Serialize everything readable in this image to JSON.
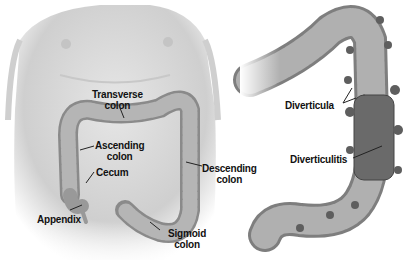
{
  "figure": {
    "left_panel": {
      "subject": "torso-with-colon",
      "labels": {
        "transverse": [
          "Transverse",
          "colon"
        ],
        "ascending": [
          "Ascending",
          "colon"
        ],
        "cecum": "Cecum",
        "appendix": "Appendix",
        "descending": [
          "Descending",
          "colon"
        ],
        "sigmoid": [
          "Sigmoid",
          "colon"
        ]
      }
    },
    "right_panel": {
      "subject": "colon-with-diverticula",
      "labels": {
        "diverticula": "Diverticula",
        "diverticulitis": "Diverticulitis"
      }
    },
    "colors": {
      "skin": "#dcdcdc",
      "skin_shadow": "#bdbdbd",
      "colon": "#a8a8a8",
      "colon_dark": "#6e6e6e",
      "pouch": "#7a7a7a",
      "label": "#111111"
    }
  }
}
